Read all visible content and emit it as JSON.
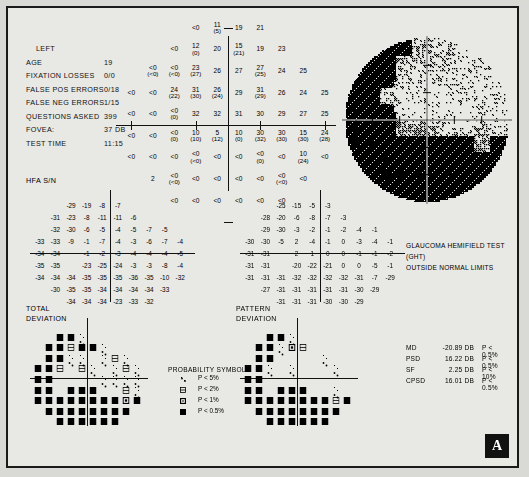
{
  "report": {
    "eye": "LEFT",
    "hfa_serial_label": "HFA S/N",
    "badge": "A",
    "fields": [
      {
        "label": "AGE",
        "value": "19",
        "indent": false
      },
      {
        "label": "FIXATION LOSSES",
        "value": "0/0",
        "indent": false
      },
      {
        "label": "FALSE POS ERRORS",
        "value": "0/18",
        "indent": false
      },
      {
        "label": "FALSE NEG ERRORS",
        "value": "1/15",
        "indent": false
      },
      {
        "label": "QUESTIONS ASKED",
        "value": "399",
        "indent": false
      },
      {
        "label": "FOVEA:",
        "value": "37 DB",
        "indent": false
      },
      {
        "label": "TEST TIME",
        "value": "11:15",
        "indent": false
      }
    ]
  },
  "grayscale": {
    "axis_label": "30°",
    "ght_line1": "GLAUCOMA HEMIFIELD TEST (GHT)",
    "ght_line2": "OUTSIDE NORMAL LIMITS"
  },
  "deviation_labels": {
    "total_line1": "TOTAL",
    "total_line2": "DEVIATION",
    "pattern_line1": "PATTERN",
    "pattern_line2": "DEVIATION"
  },
  "legend": {
    "title": "PROBABILITY SYMBOLS",
    "rows": [
      {
        "level": 1,
        "text": "P <  5%"
      },
      {
        "level": 2,
        "text": "P <  2%"
      },
      {
        "level": 3,
        "text": "P <  1%"
      },
      {
        "level": 4,
        "text": "P < 0.5%"
      }
    ]
  },
  "indices": [
    {
      "key": "MD",
      "value": "-20.89 DB",
      "prob": "P < 0.5%"
    },
    {
      "key": "PSD",
      "value": "16.22 DB",
      "prob": "P < 0.5%"
    },
    {
      "key": "SF",
      "value": "2.25 DB",
      "prob": "P <  10%"
    },
    {
      "key": "CPSD",
      "value": "16.01 DB",
      "prob": "P < 0.5%"
    }
  ],
  "chart_data": {
    "type": "table",
    "xlabel": "Horizontal eccentricity (degrees)",
    "ylabel": "Vertical eccentricity (degrees)",
    "grid": true,
    "legend_position": "bottom-center",
    "sensitivity_plot": {
      "type": "heatmap",
      "description": "Numeric threshold sensitivity values in dB; parenthesised values are retest results. '<0' denotes no response at maximum stimulus.",
      "rows": [
        {
          "y": 27,
          "cells": [
            {
              "x": -9,
              "v": "<0",
              "r": null
            },
            {
              "x": -3,
              "v": "11",
              "r": "5"
            },
            {
              "x": 3,
              "v": "19",
              "r": null
            },
            {
              "x": 9,
              "v": "21",
              "r": null
            }
          ]
        },
        {
          "y": 21,
          "cells": [
            {
              "x": -15,
              "v": "<0",
              "r": null
            },
            {
              "x": -9,
              "v": "12",
              "r": "0"
            },
            {
              "x": -3,
              "v": "20",
              "r": null
            },
            {
              "x": 3,
              "v": "15",
              "r": "21"
            },
            {
              "x": 9,
              "v": "19",
              "r": null
            },
            {
              "x": 15,
              "v": "23",
              "r": null
            }
          ]
        },
        {
          "y": 15,
          "cells": [
            {
              "x": -21,
              "v": "<0",
              "r": "<0"
            },
            {
              "x": -15,
              "v": "<0",
              "r": "<0"
            },
            {
              "x": -9,
              "v": "23",
              "r": "27"
            },
            {
              "x": -3,
              "v": "26",
              "r": null
            },
            {
              "x": 3,
              "v": "27",
              "r": null
            },
            {
              "x": 9,
              "v": "27",
              "r": "25"
            },
            {
              "x": 15,
              "v": "24",
              "r": null
            },
            {
              "x": 21,
              "v": "25",
              "r": null
            }
          ]
        },
        {
          "y": 9,
          "cells": [
            {
              "x": -27,
              "v": "<0",
              "r": null
            },
            {
              "x": -21,
              "v": "<0",
              "r": null
            },
            {
              "x": -15,
              "v": "24",
              "r": "22"
            },
            {
              "x": -9,
              "v": "31",
              "r": "30"
            },
            {
              "x": -3,
              "v": "26",
              "r": "24"
            },
            {
              "x": 3,
              "v": "29",
              "r": null
            },
            {
              "x": 9,
              "v": "31",
              "r": "29"
            },
            {
              "x": 15,
              "v": "26",
              "r": null
            },
            {
              "x": 21,
              "v": "24",
              "r": null
            },
            {
              "x": 27,
              "v": "25",
              "r": null
            }
          ]
        },
        {
          "y": 3,
          "cells": [
            {
              "x": -27,
              "v": "<0",
              "r": null
            },
            {
              "x": -21,
              "v": "<0",
              "r": null
            },
            {
              "x": -15,
              "v": "<0",
              "r": "0"
            },
            {
              "x": -9,
              "v": "32",
              "r": null
            },
            {
              "x": -3,
              "v": "32",
              "r": null
            },
            {
              "x": 3,
              "v": "31",
              "r": null
            },
            {
              "x": 9,
              "v": "30",
              "r": null
            },
            {
              "x": 15,
              "v": "29",
              "r": null
            },
            {
              "x": 21,
              "v": "27",
              "r": null
            },
            {
              "x": 27,
              "v": "25",
              "r": null
            }
          ]
        },
        {
          "y": -3,
          "cells": [
            {
              "x": -27,
              "v": "<0",
              "r": null
            },
            {
              "x": -21,
              "v": "<0",
              "r": null
            },
            {
              "x": -15,
              "v": "<0",
              "r": "0"
            },
            {
              "x": -9,
              "v": "10",
              "r": "10"
            },
            {
              "x": -3,
              "v": "5",
              "r": "12"
            },
            {
              "x": 3,
              "v": "10",
              "r": "0"
            },
            {
              "x": 9,
              "v": "30",
              "r": "32"
            },
            {
              "x": 15,
              "v": "30",
              "r": "30"
            },
            {
              "x": 21,
              "v": "15",
              "r": "30"
            },
            {
              "x": 27,
              "v": "24",
              "r": "28"
            }
          ]
        },
        {
          "y": -9,
          "cells": [
            {
              "x": -27,
              "v": "<0",
              "r": null
            },
            {
              "x": -21,
              "v": "<0",
              "r": null
            },
            {
              "x": -15,
              "v": "<0",
              "r": null
            },
            {
              "x": -9,
              "v": "<0",
              "r": "<0"
            },
            {
              "x": -3,
              "v": "<0",
              "r": null
            },
            {
              "x": 3,
              "v": "<0",
              "r": null
            },
            {
              "x": 9,
              "v": "<0",
              "r": "0"
            },
            {
              "x": 15,
              "v": "<0",
              "r": null
            },
            {
              "x": 21,
              "v": "10",
              "r": "24"
            },
            {
              "x": 27,
              "v": "<0",
              "r": null
            }
          ]
        },
        {
          "y": -15,
          "cells": [
            {
              "x": -21,
              "v": "2",
              "r": null
            },
            {
              "x": -15,
              "v": "<0",
              "r": "<0"
            },
            {
              "x": -9,
              "v": "<0",
              "r": null
            },
            {
              "x": -3,
              "v": "<0",
              "r": null
            },
            {
              "x": 3,
              "v": "<0",
              "r": null
            },
            {
              "x": 9,
              "v": "<0",
              "r": null
            },
            {
              "x": 15,
              "v": "<0",
              "r": "<0"
            },
            {
              "x": 21,
              "v": "<0",
              "r": null
            }
          ]
        },
        {
          "y": -21,
          "cells": [
            {
              "x": -15,
              "v": "<0",
              "r": null
            },
            {
              "x": -9,
              "v": "<0",
              "r": null
            },
            {
              "x": -3,
              "v": "<0",
              "r": null
            },
            {
              "x": 3,
              "v": "<0",
              "r": null
            },
            {
              "x": 9,
              "v": "<0",
              "r": null
            },
            {
              "x": 15,
              "v": "<0",
              "r": null
            }
          ]
        }
      ]
    },
    "total_deviation": {
      "type": "heatmap",
      "ylabel": "TOTAL DEVIATION (dB)",
      "rows": [
        [
          null,
          null,
          "-29",
          "-19",
          "-8",
          "-7",
          null,
          null,
          null,
          null
        ],
        [
          null,
          "-31",
          "-23",
          "-8",
          "-11",
          "-11",
          "-6",
          null,
          null,
          null
        ],
        [
          null,
          "-32",
          "-30",
          "-6",
          "-5",
          "-4",
          "-5",
          "-7",
          "-5",
          null
        ],
        [
          "-33",
          "-33",
          "-9",
          "-1",
          "-7",
          "-4",
          "-3",
          "-6",
          "-7",
          "-4"
        ],
        [
          "-34",
          "-34",
          null,
          "-1",
          "-2",
          "-3",
          "-4",
          "-4",
          "-4",
          "-5"
        ],
        [
          "-35",
          "-35",
          null,
          "-23",
          "-25",
          "-24",
          "-3",
          "-3",
          "-8",
          "-4"
        ],
        [
          "-34",
          "-34",
          "-34",
          "-35",
          "-35",
          "-35",
          "-36",
          "-35",
          "-10",
          "-32"
        ],
        [
          null,
          "-30",
          "-35",
          "-35",
          "-34",
          "-34",
          "-34",
          "-34",
          "-33",
          null
        ],
        [
          null,
          null,
          "-34",
          "-34",
          "-34",
          "-23",
          "-33",
          "-32",
          null,
          null
        ]
      ]
    },
    "pattern_deviation": {
      "type": "heatmap",
      "ylabel": "PATTERN DEVIATION (dB)",
      "rows": [
        [
          null,
          null,
          "-25",
          "-15",
          "-5",
          "-3",
          null,
          null,
          null,
          null
        ],
        [
          null,
          "-28",
          "-20",
          "-6",
          "-8",
          "-7",
          "-3",
          null,
          null,
          null
        ],
        [
          null,
          "-29",
          "-30",
          "-3",
          "-2",
          "-1",
          "-2",
          "-4",
          "-1",
          null
        ],
        [
          "-30",
          "-30",
          "-5",
          "2",
          "-4",
          "-1",
          "0",
          "-3",
          "-4",
          "-1"
        ],
        [
          "-31",
          "-31",
          null,
          "2",
          "1",
          "0",
          "0",
          "-1",
          "-1",
          "-2"
        ],
        [
          "-31",
          "-31",
          null,
          "-20",
          "-22",
          "-21",
          "0",
          "0",
          "-5",
          "-1"
        ],
        [
          "-31",
          "-31",
          "-31",
          "-32",
          "-32",
          "-32",
          "-32",
          "-31",
          "-7",
          "-29"
        ],
        [
          null,
          "-27",
          "-31",
          "-31",
          "-31",
          "-31",
          "-31",
          "-30",
          "-29",
          null
        ],
        [
          null,
          null,
          "-31",
          "-31",
          "-31",
          "-30",
          "-30",
          "-29",
          null,
          null
        ]
      ]
    },
    "total_deviation_probability": {
      "type": "heatmap",
      "description": "Probability symbol map, level 0 = within normal limits, 4 = P < 0.5%",
      "rows": [
        [
          0,
          0,
          4,
          4,
          1,
          0,
          0,
          0,
          0,
          0
        ],
        [
          0,
          4,
          4,
          2,
          4,
          4,
          1,
          0,
          0,
          0
        ],
        [
          0,
          4,
          4,
          1,
          1,
          0,
          1,
          2,
          1,
          0
        ],
        [
          4,
          4,
          2,
          0,
          2,
          1,
          0,
          1,
          2,
          1
        ],
        [
          4,
          4,
          0,
          0,
          0,
          0,
          1,
          1,
          1,
          1
        ],
        [
          4,
          4,
          0,
          4,
          4,
          4,
          0,
          0,
          2,
          1
        ],
        [
          4,
          4,
          4,
          4,
          4,
          4,
          4,
          4,
          3,
          4
        ],
        [
          0,
          4,
          4,
          4,
          4,
          4,
          4,
          4,
          4,
          0
        ],
        [
          0,
          0,
          4,
          4,
          4,
          4,
          4,
          4,
          0,
          0
        ]
      ]
    },
    "pattern_deviation_probability": {
      "type": "heatmap",
      "description": "Probability symbol map, level 0 = within normal limits, 4 = P < 0.5%",
      "rows": [
        [
          0,
          0,
          4,
          4,
          1,
          0,
          0,
          0,
          0,
          0
        ],
        [
          0,
          4,
          4,
          1,
          3,
          2,
          0,
          0,
          0,
          0
        ],
        [
          0,
          4,
          4,
          0,
          0,
          0,
          0,
          1,
          0,
          0
        ],
        [
          4,
          4,
          1,
          0,
          1,
          0,
          0,
          0,
          1,
          0
        ],
        [
          4,
          4,
          0,
          0,
          0,
          0,
          0,
          0,
          0,
          0
        ],
        [
          4,
          4,
          0,
          4,
          4,
          4,
          0,
          0,
          1,
          0
        ],
        [
          4,
          4,
          4,
          4,
          4,
          4,
          4,
          4,
          2,
          4
        ],
        [
          0,
          4,
          4,
          4,
          4,
          4,
          4,
          4,
          4,
          0
        ],
        [
          0,
          0,
          4,
          4,
          4,
          4,
          4,
          4,
          0,
          0
        ]
      ]
    }
  }
}
